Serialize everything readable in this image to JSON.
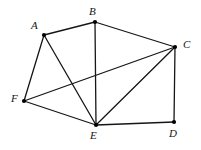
{
  "figure": {
    "name": "undirected-graph-diagram",
    "background_color": "#ffffff",
    "edge_color": "#161616",
    "vertex_color": "#000000",
    "label_color": "#141414",
    "edge_width": 1.3,
    "vertex_radius": 2.1,
    "width": 201,
    "height": 150
  },
  "chart_data": {
    "type": "diagram",
    "title": "",
    "xlabel": "",
    "ylabel": "",
    "nodes": [
      {
        "id": "A",
        "label": "A",
        "x": 44,
        "y": 35,
        "label_x": 31,
        "label_y": 20
      },
      {
        "id": "B",
        "label": "B",
        "x": 95,
        "y": 22,
        "label_x": 89,
        "label_y": 6
      },
      {
        "id": "C",
        "label": "C",
        "x": 175,
        "y": 47,
        "label_x": 183,
        "label_y": 39
      },
      {
        "id": "D",
        "label": "D",
        "x": 174,
        "y": 122,
        "label_x": 169,
        "label_y": 128
      },
      {
        "id": "E",
        "label": "E",
        "x": 96,
        "y": 125,
        "label_x": 90,
        "label_y": 130
      },
      {
        "id": "F",
        "label": "F",
        "x": 24,
        "y": 101,
        "label_x": 11,
        "label_y": 93
      }
    ],
    "edges": [
      {
        "source": "A",
        "target": "B"
      },
      {
        "source": "A",
        "target": "F"
      },
      {
        "source": "A",
        "target": "E"
      },
      {
        "source": "B",
        "target": "C"
      },
      {
        "source": "B",
        "target": "E"
      },
      {
        "source": "C",
        "target": "D"
      },
      {
        "source": "C",
        "target": "E"
      },
      {
        "source": "C",
        "target": "F"
      },
      {
        "source": "D",
        "target": "E"
      },
      {
        "source": "E",
        "target": "F"
      }
    ],
    "node_count": 6,
    "edge_count": 10
  }
}
